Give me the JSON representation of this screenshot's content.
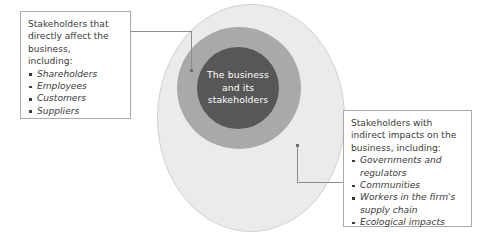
{
  "diagram": {
    "title_center": "The business\nand its\nstakeholders",
    "colors": {
      "outer_ring": "#ebebeb",
      "middle_ring": "#a9a9a9",
      "inner_circle": "#575757",
      "center_text": "#ffffff",
      "box_border": "#aaaaaa",
      "connector": "#8c8c8c",
      "body_text": "#3b3b3b"
    }
  },
  "left_callout": {
    "intro": "Stakeholders that\ndirectly affect the\nbusiness,\nincluding:",
    "items": [
      "Shareholders",
      "Employees",
      "Customers",
      "Suppliers"
    ]
  },
  "right_callout": {
    "intro": "Stakeholders with\nindirect impacts on the\nbusiness, including:",
    "items": [
      "Governments and regulators",
      "Communities",
      "Workers in the firm's supply chain",
      "Ecological impacts"
    ]
  }
}
